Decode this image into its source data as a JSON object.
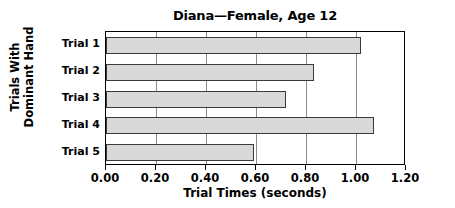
{
  "chart_data": {
    "type": "bar",
    "orientation": "horizontal",
    "title": "Diana—Female, Age 12",
    "xlabel": "Trial Times (seconds)",
    "ylabel_lines": [
      "Trials With",
      "Dominant Hand"
    ],
    "categories": [
      "Trial 1",
      "Trial 2",
      "Trial 3",
      "Trial 4",
      "Trial 5"
    ],
    "values": [
      1.02,
      0.83,
      0.72,
      1.07,
      0.59
    ],
    "xlim": [
      0.0,
      1.2
    ],
    "xticks": [
      0.0,
      0.2,
      0.4,
      0.6,
      0.8,
      1.0,
      1.2
    ],
    "xtick_labels": [
      "0.00",
      "0.20",
      "0.40",
      "0.60",
      "0.80",
      "1.00",
      "1.20"
    ],
    "grid": "vertical",
    "legend": "none",
    "bar_fill_color": "#d9d9d9",
    "bar_border_color": "#3a3a3a",
    "axis_color": "#000000",
    "gridline_color": "#8a8a8a",
    "background_color": "#ffffff"
  }
}
